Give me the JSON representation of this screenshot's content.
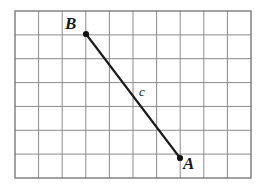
{
  "figure": {
    "background_color": "#ffffff",
    "grid": {
      "x": 15,
      "y": 11,
      "width": 236,
      "height": 167,
      "columns": 10,
      "rows": 7,
      "cell_width": 23.6,
      "cell_height": 23.857,
      "line_color": "#8a8a8a",
      "line_width": 1,
      "border_color": "#7a7a7a",
      "border_width": 1.4
    },
    "segment": {
      "name": "c",
      "label": "c",
      "stroke_color": "#1a1a1a",
      "stroke_width": 2.1,
      "endpoints": [
        {
          "label": "B",
          "x": 86,
          "y": 34,
          "grid_col": 3,
          "grid_row": 1
        },
        {
          "label": "A",
          "x": 180,
          "y": 158,
          "grid_col": 7,
          "grid_row": 6.2
        }
      ]
    },
    "points": [
      {
        "name": "point-B",
        "label": "B",
        "x": 86,
        "y": 34,
        "radius": 3.1,
        "fill": "#111111"
      },
      {
        "name": "point-A",
        "label": "A",
        "x": 180,
        "y": 158,
        "radius": 3.1,
        "fill": "#111111"
      }
    ],
    "labels": {
      "vertex_b": "B",
      "vertex_a": "A",
      "segment_c": "c"
    }
  }
}
